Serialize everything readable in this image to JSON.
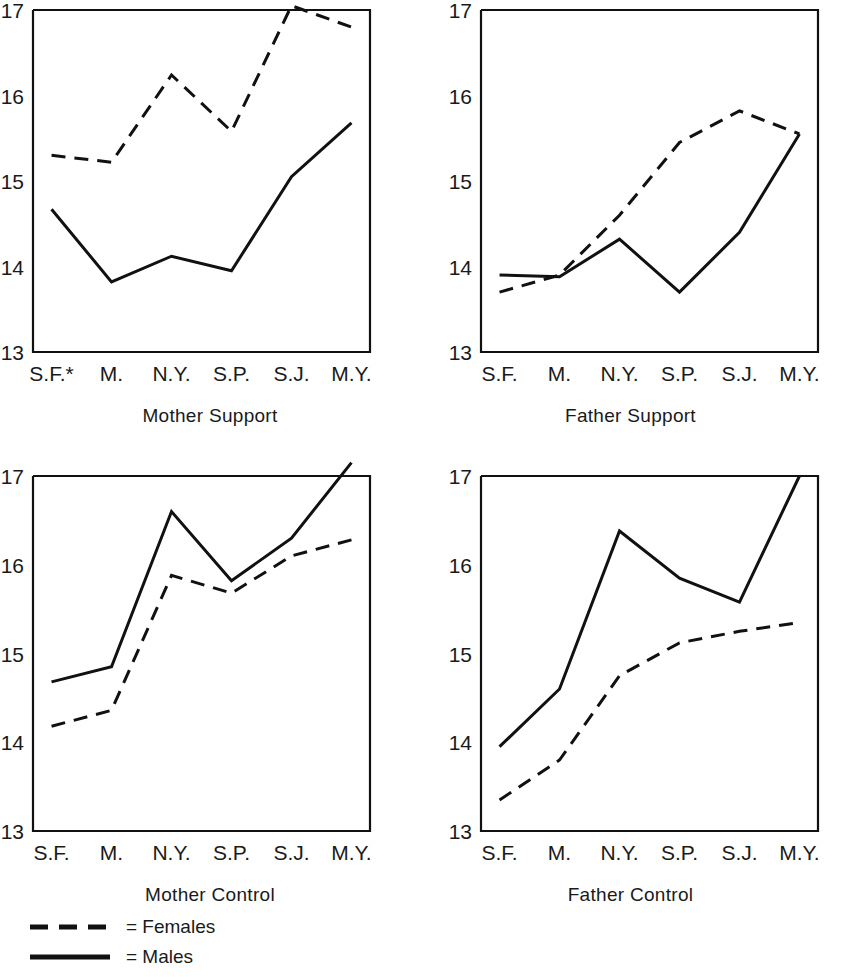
{
  "figure": {
    "background": "#ffffff",
    "ink_color": "#111111"
  },
  "legend": {
    "position": "bottom-left",
    "entries": [
      {
        "style": "dashed",
        "label": "= Females"
      },
      {
        "style": "solid",
        "label": "= Males"
      }
    ]
  },
  "axis": {
    "y_ticks": [
      "17",
      "16",
      "15",
      "14",
      "13"
    ],
    "y_min": 13,
    "y_max": 17,
    "x_ticks_default": [
      "S.F.",
      "M.",
      "N.Y.",
      "S.P.",
      "S.J.",
      "M.Y."
    ],
    "x_ticks_footnoted": [
      "S.F.*",
      "M.",
      "N.Y.",
      "S.P.",
      "S.J.",
      "M.Y."
    ]
  },
  "chart_data": [
    {
      "type": "line",
      "title": "Mother Support",
      "panel": "top-left",
      "xlabel": "",
      "ylabel": "",
      "ylim": [
        13,
        17
      ],
      "grid": false,
      "legend_position": "figure-bottom-left",
      "categories": [
        "S.F.*",
        "M.",
        "N.Y.",
        "S.P.",
        "S.J.",
        "M.Y."
      ],
      "series": [
        {
          "name": "Females",
          "style": "dashed",
          "values": [
            15.3,
            15.22,
            16.24,
            15.58,
            17.05,
            16.8
          ]
        },
        {
          "name": "Males",
          "style": "solid",
          "values": [
            14.67,
            13.82,
            14.12,
            13.95,
            15.05,
            15.68
          ]
        }
      ],
      "annotations": [
        "asterisk footnote on S.F."
      ]
    },
    {
      "type": "line",
      "title": "Father Support",
      "panel": "top-right",
      "xlabel": "",
      "ylabel": "",
      "ylim": [
        13,
        17
      ],
      "grid": false,
      "categories": [
        "S.F.",
        "M.",
        "N.Y.",
        "S.P.",
        "S.J.",
        "M.Y."
      ],
      "series": [
        {
          "name": "Females",
          "style": "dashed",
          "values": [
            13.7,
            13.9,
            14.6,
            15.45,
            15.82,
            15.55
          ]
        },
        {
          "name": "Males",
          "style": "solid",
          "values": [
            13.9,
            13.88,
            14.32,
            13.7,
            14.4,
            15.55
          ]
        }
      ],
      "annotations": []
    },
    {
      "type": "line",
      "title": "Mother Control",
      "panel": "bottom-left",
      "xlabel": "",
      "ylabel": "",
      "ylim": [
        13,
        17
      ],
      "grid": false,
      "categories": [
        "S.F.",
        "M.",
        "N.Y.",
        "S.P.",
        "S.J.",
        "M.Y."
      ],
      "series": [
        {
          "name": "Females",
          "style": "dashed",
          "values": [
            14.18,
            14.36,
            15.88,
            15.68,
            16.1,
            16.28
          ]
        },
        {
          "name": "Males",
          "style": "solid",
          "values": [
            14.68,
            14.85,
            16.6,
            15.82,
            16.3,
            17.15
          ]
        }
      ],
      "annotations": []
    },
    {
      "type": "line",
      "title": "Father Control",
      "panel": "bottom-right",
      "xlabel": "",
      "ylabel": "",
      "ylim": [
        13,
        17
      ],
      "grid": false,
      "categories": [
        "S.F.",
        "M.",
        "N.Y.",
        "S.P.",
        "S.J.",
        "M.Y."
      ],
      "series": [
        {
          "name": "Females",
          "style": "dashed",
          "values": [
            13.35,
            13.8,
            14.75,
            15.12,
            15.25,
            15.35
          ]
        },
        {
          "name": "Males",
          "style": "solid",
          "values": [
            13.95,
            14.6,
            16.38,
            15.85,
            15.58,
            17.0
          ]
        }
      ],
      "annotations": []
    }
  ]
}
